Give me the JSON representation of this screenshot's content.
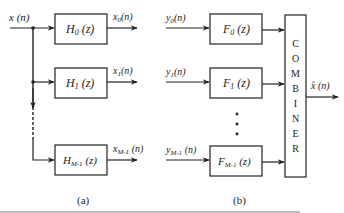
{
  "diagram": {
    "analysis_bank": {
      "input_label": "x (n)",
      "filters": [
        {
          "name": "H",
          "sub": "0",
          "arg": " (z)",
          "output": "x",
          "out_sub": "0",
          "out_arg": "(n)"
        },
        {
          "name": "H",
          "sub": "1",
          "arg": " (z)",
          "output": "x",
          "out_sub": "1",
          "out_arg": "(n)"
        },
        {
          "name": "H",
          "sub": "M-1",
          "arg": " (z)",
          "output": "x",
          "out_sub": "M-1",
          "out_arg": " (n)"
        }
      ],
      "caption": "(a)"
    },
    "synthesis_bank": {
      "inputs": [
        {
          "name": "y",
          "sub": "0",
          "arg": "(n)"
        },
        {
          "name": "y",
          "sub": "1",
          "arg": "(n)"
        },
        {
          "name": "y",
          "sub": "M-1",
          "arg": " (n)"
        }
      ],
      "filters": [
        {
          "name": "F",
          "sub": "0",
          "arg": " (z)"
        },
        {
          "name": "F",
          "sub": "1",
          "arg": " (z)"
        },
        {
          "name": "F",
          "sub": "M-1",
          "arg": " (z)"
        }
      ],
      "combiner_letters": [
        "C",
        "O",
        "M",
        "B",
        "I",
        "N",
        "E",
        "R"
      ],
      "output_label": "x̂ (n)",
      "caption": "(b)"
    }
  }
}
